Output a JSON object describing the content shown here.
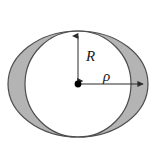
{
  "figure": {
    "title": "",
    "background_color": "#ffffff",
    "shaded_fill_color": "#b4b4b4",
    "outline_color": "#4d4d4d",
    "annotation_color": "#2b2b2b",
    "labels": {
      "radius_label": "R",
      "semi_axis_label": "ρ"
    },
    "center_point": {
      "x": 78,
      "y": 84,
      "dot_radius": 3.4,
      "name": "center-dot"
    },
    "ellipse": {
      "cx": 78,
      "cy": 84,
      "rx": 70,
      "ry": 53,
      "stroke_width": 1.2
    },
    "circle": {
      "cx": 78,
      "cy": 84,
      "r": 53,
      "stroke_width": 1.2
    },
    "arrows": {
      "radius_arrow": {
        "from_x": 78,
        "from_y": 84,
        "to_x": 78,
        "to_y": 32,
        "direction": "up"
      },
      "semi_axis_arrow": {
        "from_x": 78,
        "from_y": 84,
        "to_x": 147,
        "to_y": 84,
        "direction": "right"
      }
    },
    "label_positions": {
      "radius_label_x": 86,
      "radius_label_y": 61,
      "semi_axis_label_x": 103,
      "semi_axis_label_y": 81
    }
  }
}
